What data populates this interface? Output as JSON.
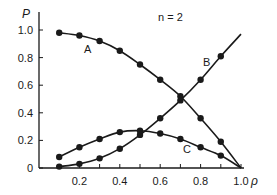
{
  "chart_data": {
    "type": "line",
    "title": "",
    "annotation": "n = 2",
    "xlabel": "ρ",
    "ylabel": "P",
    "xlim": [
      0,
      1.0
    ],
    "ylim": [
      0,
      1.0
    ],
    "grid": false,
    "legend": "inline curve labels",
    "xticks": [
      0.1,
      0.2,
      0.3,
      0.4,
      0.5,
      0.6,
      0.7,
      0.8,
      0.9,
      1.0
    ],
    "xtick_labels": [
      "0.2",
      "0.4",
      "0.6",
      "0.8",
      "1.0"
    ],
    "ytick_labels": [
      "0",
      "0.2",
      "0.4",
      "0.6",
      "0.8",
      "1.0"
    ],
    "x": [
      0.1,
      0.2,
      0.3,
      0.4,
      0.5,
      0.6,
      0.7,
      0.8,
      0.9,
      1.0
    ],
    "series": [
      {
        "name": "A",
        "values": [
          0.98,
          0.96,
          0.92,
          0.85,
          0.75,
          0.64,
          0.52,
          0.36,
          0.19,
          0.0
        ]
      },
      {
        "name": "B",
        "values": [
          0.01,
          0.03,
          0.07,
          0.14,
          0.24,
          0.36,
          0.49,
          0.64,
          0.81,
          0.97
        ]
      },
      {
        "name": "C",
        "values": [
          0.08,
          0.15,
          0.21,
          0.26,
          0.27,
          0.25,
          0.21,
          0.15,
          0.09,
          0.0
        ]
      }
    ]
  },
  "labels": {
    "annotation": "n = 2",
    "xlabel": "ρ",
    "ylabel": "P",
    "curve_a": "A",
    "curve_b": "B",
    "curve_c": "C",
    "y_ticks": [
      "0",
      "0.2",
      "0.4",
      "0.6",
      "0.8",
      "1.0"
    ],
    "x_ticks": [
      "0.2",
      "0.4",
      "0.6",
      "0.8",
      "1.0"
    ]
  },
  "colors": {
    "ink": "#1a1a1a",
    "background": "#ffffff"
  }
}
